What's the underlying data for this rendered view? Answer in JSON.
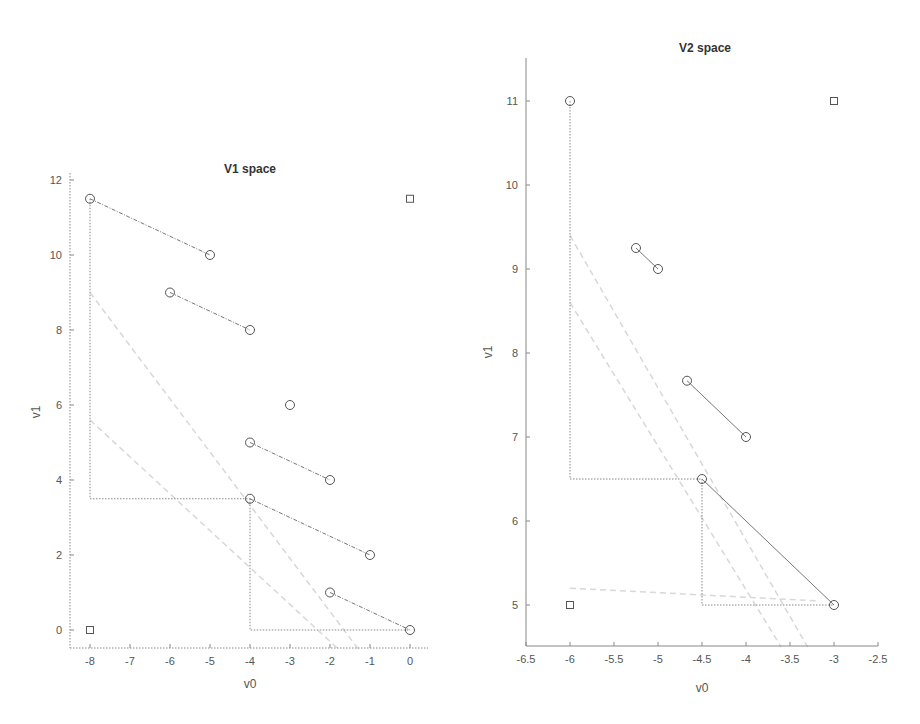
{
  "chart_data": [
    {
      "type": "scatter",
      "title": "V1 space",
      "xlabel": "v0",
      "ylabel": "v1",
      "xlim": [
        -8.5,
        0.5
      ],
      "ylim": [
        -0.5,
        12
      ],
      "xticks": [
        -8,
        -7,
        -6,
        -5,
        -4,
        -3,
        -2,
        -1,
        0
      ],
      "yticks": [
        0,
        2,
        4,
        6,
        8,
        10,
        12
      ],
      "grid": false,
      "circle_points": [
        [
          -8,
          11.5
        ],
        [
          -5,
          10
        ],
        [
          -6,
          9
        ],
        [
          -4,
          8
        ],
        [
          -3,
          6
        ],
        [
          -4,
          5
        ],
        [
          -2,
          4
        ],
        [
          -4,
          3.5
        ],
        [
          -1,
          2
        ],
        [
          -2,
          1
        ],
        [
          0,
          0
        ]
      ],
      "square_points": [
        [
          -8,
          0
        ],
        [
          0,
          11.5
        ]
      ],
      "segments": [
        {
          "from": [
            -8,
            11.5
          ],
          "to": [
            -5,
            10
          ],
          "style": "dashdot"
        },
        {
          "from": [
            -6,
            9
          ],
          "to": [
            -4,
            8
          ],
          "style": "dashdot"
        },
        {
          "from": [
            -4,
            5
          ],
          "to": [
            -2,
            4
          ],
          "style": "dashdot"
        },
        {
          "from": [
            -4,
            3.5
          ],
          "to": [
            -1,
            2
          ],
          "style": "dashdot"
        },
        {
          "from": [
            -2,
            1
          ],
          "to": [
            0,
            0
          ],
          "style": "dashdot"
        }
      ],
      "boxes": [
        {
          "path": [
            [
              -8,
              11.5
            ],
            [
              -8,
              3.5
            ],
            [
              -4,
              3.5
            ]
          ],
          "style": "dotted"
        },
        {
          "path": [
            [
              -4,
              3.5
            ],
            [
              -4,
              0
            ],
            [
              0,
              0
            ]
          ],
          "style": "dotted"
        }
      ],
      "faint_lines": [
        {
          "from": [
            -8,
            9
          ],
          "to": [
            -1.3,
            -0.5
          ]
        },
        {
          "from": [
            -8,
            5.6
          ],
          "to": [
            -1.8,
            -0.5
          ]
        }
      ]
    },
    {
      "type": "scatter",
      "title": "V2 space",
      "xlabel": "v0",
      "ylabel": "v1",
      "xlim": [
        -6.5,
        -2.5
      ],
      "ylim": [
        4.5,
        11.5
      ],
      "xticks": [
        -6.5,
        -6,
        -5.5,
        -5,
        -4.5,
        -4,
        -3.5,
        -3,
        -2.5
      ],
      "yticks": [
        5,
        6,
        7,
        8,
        9,
        10,
        11
      ],
      "grid": false,
      "circle_points": [
        [
          -6,
          11
        ],
        [
          -5.25,
          9.25
        ],
        [
          -5,
          9
        ],
        [
          -4.67,
          7.67
        ],
        [
          -4,
          7
        ],
        [
          -4.5,
          6.5
        ],
        [
          -3,
          5
        ]
      ],
      "square_points": [
        [
          -6,
          5
        ],
        [
          -3,
          11
        ]
      ],
      "segments": [
        {
          "from": [
            -5.25,
            9.25
          ],
          "to": [
            -5,
            9
          ],
          "style": "solid"
        },
        {
          "from": [
            -4.67,
            7.67
          ],
          "to": [
            -4,
            7
          ],
          "style": "solid"
        },
        {
          "from": [
            -4.5,
            6.5
          ],
          "to": [
            -3,
            5
          ],
          "style": "solid"
        }
      ],
      "boxes": [
        {
          "path": [
            [
              -6,
              11
            ],
            [
              -6,
              6.5
            ],
            [
              -4.5,
              6.5
            ]
          ],
          "style": "dotted"
        },
        {
          "path": [
            [
              -4.5,
              6.5
            ],
            [
              -4.5,
              5
            ],
            [
              -3,
              5
            ]
          ],
          "style": "dotted"
        }
      ],
      "faint_lines": [
        {
          "from": [
            -6,
            9.4
          ],
          "to": [
            -3.3,
            4.5
          ]
        },
        {
          "from": [
            -6,
            8.6
          ],
          "to": [
            -3.6,
            4.5
          ]
        },
        {
          "from": [
            -6,
            5.2
          ],
          "to": [
            -3.2,
            5.05
          ]
        }
      ]
    }
  ],
  "layout": [
    {
      "plot": {
        "left": 70,
        "top": 173,
        "right": 428,
        "bottom": 648
      },
      "xpx": [
        90,
        410
      ],
      "xval": [
        -8,
        0
      ],
      "ypx": [
        630,
        180
      ],
      "yval": [
        0,
        12
      ]
    },
    {
      "plot": {
        "left": 526,
        "top": 58,
        "right": 878,
        "bottom": 646
      },
      "xpx": [
        526,
        878
      ],
      "xval": [
        -6.5,
        -2.5
      ],
      "ypx": [
        605,
        101
      ],
      "yval": [
        5,
        11
      ]
    }
  ],
  "colors": {
    "marker": "#555555",
    "line": "#777777",
    "faint": "#d8d8d8",
    "axis": "#888888"
  }
}
